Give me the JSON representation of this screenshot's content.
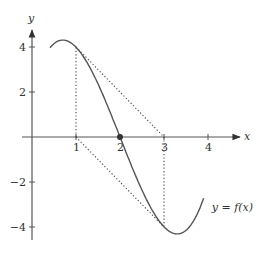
{
  "chart_data": {
    "type": "line",
    "title": "",
    "xlabel": "x",
    "ylabel": "y",
    "xlim": [
      0,
      4.5
    ],
    "ylim": [
      -4.5,
      4.5
    ],
    "x_ticks": [
      1,
      2,
      3,
      4
    ],
    "y_ticks": [
      4,
      2,
      -2,
      -4
    ],
    "grid": false,
    "series": [
      {
        "name": "y = f(x)",
        "function": "0.98*(x-2)^3 - 4.97*(x-2)",
        "x_range": [
          0.41,
          3.9
        ],
        "points": [
          [
            0.41,
            3.96
          ],
          [
            0.7,
            4.3
          ],
          [
            1,
            3.99
          ],
          [
            2,
            0
          ],
          [
            3,
            -3.99
          ],
          [
            3.3,
            -4.3
          ],
          [
            3.9,
            -2.72
          ]
        ]
      }
    ],
    "annotations": [
      {
        "type": "point",
        "x": 2,
        "y": 0,
        "label": "filled dot on x-axis"
      },
      {
        "type": "dotted-vertical",
        "x": 1,
        "from_y": 0,
        "to_y": 4
      },
      {
        "type": "dotted-vertical",
        "x": 3,
        "from_y": 0,
        "to_y": -4
      },
      {
        "type": "dotted-segment",
        "from": [
          1,
          4
        ],
        "to": [
          3,
          0
        ]
      },
      {
        "type": "dotted-segment",
        "from": [
          1,
          0
        ],
        "to": [
          3,
          -4
        ]
      },
      {
        "type": "label",
        "text": "y = f(x)",
        "x": 3.95,
        "y": -3.3
      }
    ]
  },
  "labels": {
    "x_axis": "x",
    "y_axis": "y",
    "curve": "y = f(x)",
    "x_ticks": [
      "1",
      "2",
      "3",
      "4"
    ],
    "y_ticks": [
      "4",
      "2",
      "−2",
      "−4"
    ]
  }
}
